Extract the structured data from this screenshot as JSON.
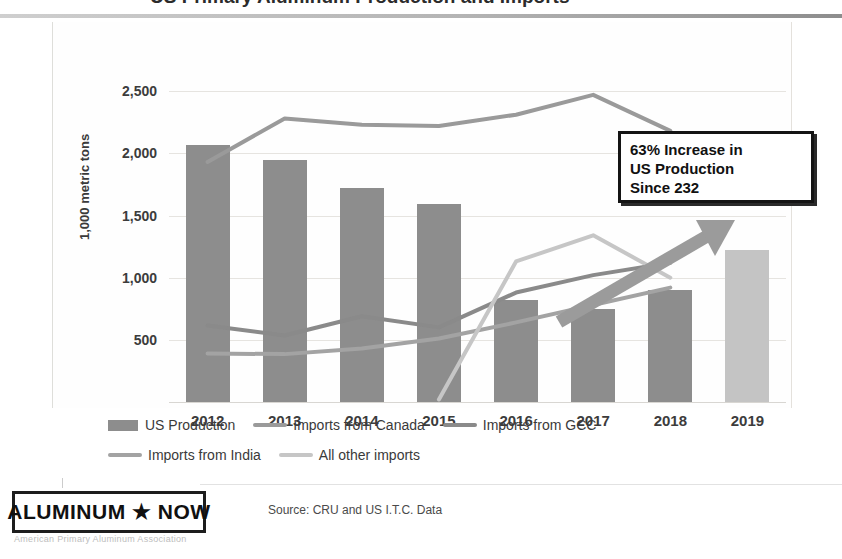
{
  "title": {
    "text": "US Primary Aluminum Production and Imports"
  },
  "axis": {
    "y_title": "1,000 metric tons",
    "y_ticks": [
      "2,500",
      "2,000",
      "1,500",
      "1,000",
      "500"
    ]
  },
  "callout": {
    "line1": "63% Increase in",
    "line2": "US Production",
    "line3": "Since 232"
  },
  "legend": {
    "row1": [
      {
        "label": "US Production",
        "type": "bar",
        "color": "#8d8d8d"
      },
      {
        "label": "Imports from Canada",
        "type": "line",
        "color": "#9a9a9a"
      },
      {
        "label": "Imports from GCC",
        "type": "line",
        "color": "#8a8a8a"
      }
    ],
    "row2": [
      {
        "label": "Imports from India",
        "type": "line",
        "color": "#a3a3a3"
      },
      {
        "label": "All other imports",
        "type": "line",
        "color": "#c6c6c6"
      }
    ]
  },
  "footer": {
    "logo": "ALUMINUM ★ NOW",
    "logo_sub": "American Primary Aluminum Association",
    "source": "Source: CRU and US I.T.C. Data"
  },
  "chart_data": {
    "type": "bar",
    "title": "US Primary Aluminum Production and Imports",
    "xlabel": "",
    "ylabel": "1,000 metric tons",
    "ylim": [
      0,
      2750
    ],
    "ytick_values": [
      500,
      1000,
      1500,
      2000,
      2500
    ],
    "grid": true,
    "legend_position": "bottom",
    "categories": [
      "2012",
      "2013",
      "2014",
      "2015",
      "2016",
      "2017",
      "2018",
      "2019"
    ],
    "series": [
      {
        "name": "US Production",
        "type": "bar",
        "color": "#8d8d8d",
        "highlight_color": "#c4c4c4",
        "highlight_index": 7,
        "values": [
          2070,
          1950,
          1720,
          1590,
          820,
          745,
          900,
          1220
        ]
      },
      {
        "name": "Imports from Canada",
        "type": "line",
        "color": "#9a9a9a",
        "values": [
          1930,
          2280,
          2230,
          2220,
          2310,
          2470,
          2180,
          null
        ]
      },
      {
        "name": "Imports from GCC",
        "type": "line",
        "color": "#8a8a8a",
        "values": [
          615,
          535,
          690,
          600,
          880,
          1020,
          1120,
          null
        ]
      },
      {
        "name": "Imports from India",
        "type": "line",
        "color": "#a3a3a3",
        "values": [
          390,
          385,
          430,
          510,
          640,
          780,
          920,
          null
        ]
      },
      {
        "name": "All other imports",
        "type": "line",
        "color": "#c6c6c6",
        "values": [
          null,
          null,
          null,
          20,
          1130,
          1340,
          1000,
          null
        ]
      }
    ],
    "annotations": [
      {
        "name": "increase-callout",
        "text": "63% Increase in US Production Since 232",
        "arrow": "upward arrow from 2017 to 2019"
      }
    ]
  }
}
